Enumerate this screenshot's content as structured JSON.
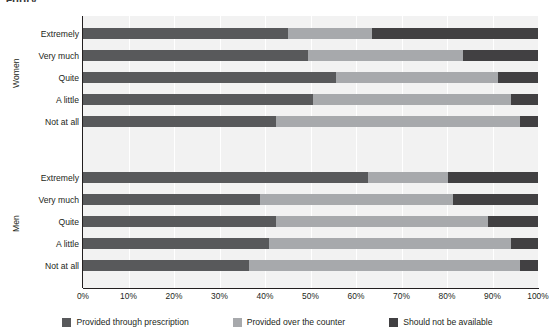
{
  "partial_title": "egory",
  "chart_data": {
    "type": "bar",
    "orientation": "horizontal",
    "stacked": true,
    "title": "",
    "xlabel": "",
    "ylabel": "",
    "xlim": [
      0,
      100
    ],
    "grid": true,
    "legend_position": "bottom",
    "x_ticks": [
      "0%",
      "10%",
      "20%",
      "30%",
      "40%",
      "50%",
      "60%",
      "70%",
      "80%",
      "90%",
      "100%"
    ],
    "x_tick_values": [
      0,
      10,
      20,
      30,
      40,
      50,
      60,
      70,
      80,
      90,
      100
    ],
    "series": [
      {
        "name": "Provided through prescription",
        "color": "#58595b"
      },
      {
        "name": "Provided over the counter",
        "color": "#a7a9ac"
      },
      {
        "name": "Should  not be available",
        "color": "#414042"
      }
    ],
    "groups": [
      {
        "label": "Women",
        "categories": [
          "Extremely",
          "Very much",
          "Quite",
          "A little",
          "Not at all"
        ],
        "values": [
          [
            45.0,
            18.5,
            36.5
          ],
          [
            49.5,
            34.0,
            16.5
          ],
          [
            55.6,
            35.6,
            8.8
          ],
          [
            50.5,
            43.6,
            5.9
          ],
          [
            42.4,
            53.6,
            4.0
          ]
        ]
      },
      {
        "label": "Men",
        "categories": [
          "Extremely",
          "Very much",
          "Quite",
          "A little",
          "Not at all"
        ],
        "values": [
          [
            62.6,
            17.6,
            19.8
          ],
          [
            38.9,
            42.4,
            18.7
          ],
          [
            42.4,
            46.6,
            11.0
          ],
          [
            40.9,
            53.2,
            5.9
          ],
          [
            36.5,
            59.5,
            4.0
          ]
        ]
      }
    ]
  },
  "legend": {
    "items": [
      {
        "label": "Provided through prescription",
        "color": "#58595b"
      },
      {
        "label": "Provided over the counter",
        "color": "#a7a9ac"
      },
      {
        "label": "Should  not be available",
        "color": "#414042"
      }
    ]
  }
}
